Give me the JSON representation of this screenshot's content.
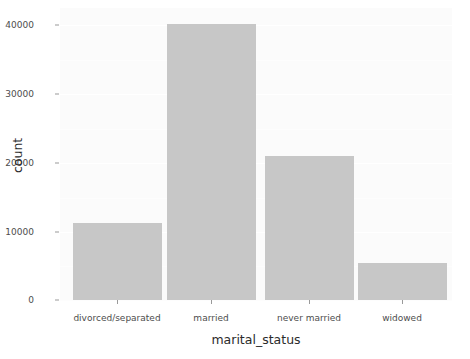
{
  "chart_data": {
    "type": "bar",
    "title": "",
    "subtitle": "",
    "xlabel": "marital_status",
    "ylabel": "count",
    "categories": [
      "divorced/separated",
      "married",
      "never married",
      "widowed"
    ],
    "values": [
      10880,
      39300,
      20440,
      5290
    ],
    "ylim": [
      0,
      41500
    ],
    "yticks": [
      0,
      10000,
      20000,
      30000,
      40000
    ],
    "ytick_labels": [
      "0",
      "10000",
      "20000",
      "30000",
      "40000"
    ],
    "grid": true,
    "legend": "none",
    "bar_color": "#c7c7c7",
    "panel_color": "#fbfbfb",
    "gridline_color": "#ffffff",
    "axis_text_color": "#4d4d4d",
    "axis_title_color": "#2b2b2b"
  }
}
